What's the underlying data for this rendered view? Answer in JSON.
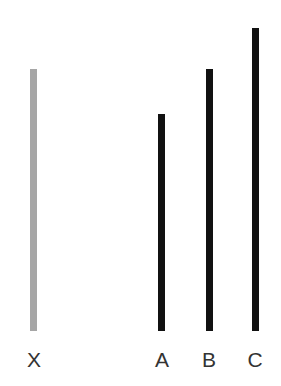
{
  "diagram": {
    "title": "",
    "reference_line": {
      "label": "X",
      "color": "#a6a6a6",
      "top": 69,
      "bottom": 331,
      "left": 30
    },
    "comparison_lines": [
      {
        "label": "A",
        "color": "#111111",
        "top": 114,
        "bottom": 331,
        "left": 158
      },
      {
        "label": "B",
        "color": "#111111",
        "top": 69,
        "bottom": 331,
        "left": 206
      },
      {
        "label": "C",
        "color": "#111111",
        "top": 28,
        "bottom": 331,
        "left": 252
      }
    ]
  }
}
